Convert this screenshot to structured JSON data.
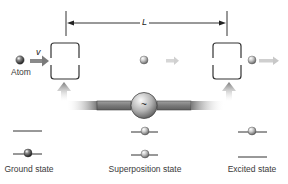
{
  "diagram": {
    "distance_label": "L",
    "velocity_label": "v",
    "atom_label": "Atom",
    "oscillator_symbol": "~",
    "states": [
      {
        "label": "Ground state",
        "upper_level_ball": false,
        "lower_level_ball": true
      },
      {
        "label": "Superposition state",
        "upper_level_ball": true,
        "lower_level_ball": true
      },
      {
        "label": "Excited state",
        "upper_level_ball": true,
        "lower_level_ball": false
      }
    ],
    "icons": {
      "atom": "sphere",
      "cavity": "bracket-box",
      "oscillator": "sine-source-circle",
      "arrow": "flow-arrow"
    },
    "colors": {
      "line": "#333333",
      "arrow_gray": "#8a8a8a",
      "bar_gray": "#7d7d7d",
      "text": "#3a3a3a"
    }
  }
}
